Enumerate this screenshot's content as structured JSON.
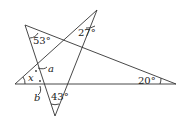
{
  "diagram": {
    "type": "geometry-star-angles",
    "vertices": {
      "A": [
        25,
        25
      ],
      "B": [
        97,
        10
      ],
      "C": [
        15,
        84
      ],
      "D": [
        176,
        84
      ],
      "E": [
        55,
        116
      ]
    },
    "segments": [
      [
        "A",
        "E"
      ],
      [
        "A",
        "D"
      ],
      [
        "C",
        "B"
      ],
      [
        "B",
        "E"
      ],
      [
        "C",
        "D"
      ]
    ],
    "labels": {
      "angle_A": "53°",
      "angle_B": "27°",
      "angle_D": "20°",
      "angle_E": "43°",
      "x": "x",
      "a": "a",
      "b": "b"
    },
    "line_color": "#333333"
  }
}
